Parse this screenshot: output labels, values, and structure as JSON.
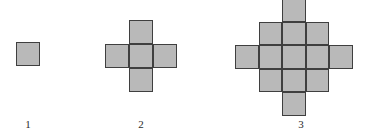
{
  "diagram": {
    "type": "geometric-growth-sequence",
    "background_color": "#ffffff",
    "cell_fill_color": "#b9b9b9",
    "cell_stroke_color": "#3f3f3f",
    "label_color": "#2b2b2b",
    "figures": [
      {
        "label": "1",
        "step": 1,
        "square_count": 1,
        "shape": "single-square",
        "cell_size": 24,
        "origin_x": 16,
        "origin_y": 42,
        "label_x": 4,
        "label_y": 118,
        "label_width": 48,
        "cells": [
          {
            "col": 0,
            "row": 0
          }
        ]
      },
      {
        "label": "2",
        "step": 2,
        "square_count": 5,
        "shape": "plus-cross",
        "cell_size": 24,
        "origin_x": 105,
        "origin_y": 20,
        "label_x": 117,
        "label_y": 118,
        "label_width": 48,
        "cells": [
          {
            "col": 1,
            "row": 0
          },
          {
            "col": 0,
            "row": 1
          },
          {
            "col": 1,
            "row": 1
          },
          {
            "col": 2,
            "row": 1
          },
          {
            "col": 1,
            "row": 2
          }
        ]
      },
      {
        "label": "3",
        "step": 3,
        "square_count": 13,
        "shape": "diamond",
        "cell_size": 23.6,
        "origin_x": 235,
        "origin_y": -2,
        "label_x": 277,
        "label_y": 118,
        "label_width": 48,
        "cells": [
          {
            "col": 2,
            "row": 0
          },
          {
            "col": 1,
            "row": 1
          },
          {
            "col": 2,
            "row": 1
          },
          {
            "col": 3,
            "row": 1
          },
          {
            "col": 0,
            "row": 2
          },
          {
            "col": 1,
            "row": 2
          },
          {
            "col": 2,
            "row": 2
          },
          {
            "col": 3,
            "row": 2
          },
          {
            "col": 4,
            "row": 2
          },
          {
            "col": 1,
            "row": 3
          },
          {
            "col": 2,
            "row": 3
          },
          {
            "col": 3,
            "row": 3
          },
          {
            "col": 2,
            "row": 4
          }
        ]
      }
    ]
  }
}
